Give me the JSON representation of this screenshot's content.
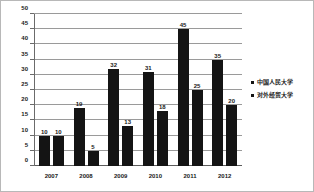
{
  "chart_data": {
    "type": "bar",
    "title": "",
    "subtitle": "",
    "xlabel": "",
    "ylabel": "",
    "categories": [
      "2007",
      "2008",
      "2009",
      "2010",
      "2011",
      "2012"
    ],
    "series": [
      {
        "name": "中国人民大学",
        "values": [
          10,
          19,
          32,
          31,
          45,
          35
        ],
        "color": "#141414"
      },
      {
        "name": "对外经贸大学",
        "values": [
          10,
          5,
          13,
          18,
          25,
          20
        ],
        "color": "#141414"
      }
    ],
    "ylim": [
      0,
      50
    ],
    "yticks": [
      0,
      5,
      10,
      15,
      20,
      25,
      30,
      35,
      40,
      45,
      50
    ],
    "ytick_labels": [
      "0",
      "5",
      "10",
      "15",
      "20",
      "25",
      "30",
      "35",
      "40",
      "45",
      "50"
    ],
    "grid": true,
    "grid_axis": "y",
    "legend_position": "right",
    "data_labels": true,
    "background": "#ffffff",
    "border_color": "#b8b8b8"
  },
  "legend": {
    "items": [
      {
        "label": "中国人民大学",
        "marker": "square-marker"
      },
      {
        "label": "对外经贸大学",
        "marker": "square-marker"
      }
    ]
  }
}
